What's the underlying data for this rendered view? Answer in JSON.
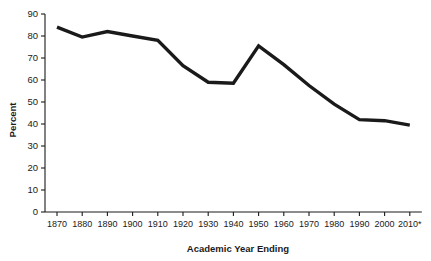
{
  "chart_data": {
    "type": "line",
    "title": "",
    "subtitle": "",
    "xlabel": "Academic Year Ending",
    "ylabel": "Percent",
    "categories": [
      "1870",
      "1880",
      "1890",
      "1900",
      "1910",
      "1920",
      "1930",
      "1940",
      "1950",
      "1960",
      "1970",
      "1980",
      "1990",
      "2000",
      "2010*"
    ],
    "values": [
      84,
      79.5,
      82,
      80,
      78,
      66.5,
      59,
      58.5,
      75.5,
      67,
      57.5,
      49,
      42,
      41.5,
      39.5
    ],
    "series": [
      {
        "name": "Percent",
        "values": [
          84,
          79.5,
          82,
          80,
          78,
          66.5,
          59,
          58.5,
          75.5,
          67,
          57.5,
          49,
          42,
          41.5,
          39.5
        ],
        "color": "#1a1a1a"
      }
    ],
    "ylim": [
      0,
      90
    ],
    "y_ticks": [
      0,
      10,
      20,
      30,
      40,
      50,
      60,
      70,
      80,
      90
    ],
    "y_tick_labels": [
      "0",
      "10",
      "20",
      "30",
      "40",
      "50",
      "60",
      "70",
      "80",
      "90"
    ],
    "x_tick_labels": [
      "1870",
      "1880",
      "1890",
      "1900",
      "1910",
      "1920",
      "1930",
      "1940",
      "1950",
      "1960",
      "1970",
      "1980",
      "1990",
      "2000",
      "2010*"
    ],
    "grid": false,
    "legend": "none",
    "line_color": "#1a1a1a",
    "background_color": "#ffffff"
  }
}
